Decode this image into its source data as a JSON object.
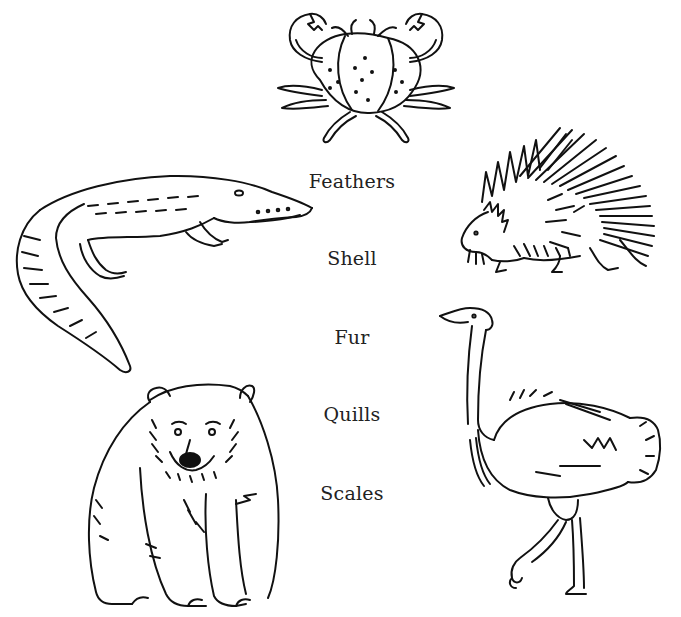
{
  "worksheet": {
    "words": [
      {
        "label": "Feathers",
        "x": 352,
        "y": 170
      },
      {
        "label": "Shell",
        "x": 352,
        "y": 247
      },
      {
        "label": "Fur",
        "x": 352,
        "y": 326
      },
      {
        "label": "Quills",
        "x": 352,
        "y": 403
      },
      {
        "label": "Scales",
        "x": 352,
        "y": 482
      }
    ],
    "animals": [
      {
        "name": "crab",
        "position": "top-center"
      },
      {
        "name": "crocodile",
        "position": "left-upper"
      },
      {
        "name": "porcupine",
        "position": "right-upper"
      },
      {
        "name": "bear",
        "position": "left-lower"
      },
      {
        "name": "ostrich",
        "position": "right-lower"
      }
    ],
    "colors": {
      "ink": "#111111",
      "text": "#222222",
      "background": "#ffffff"
    }
  }
}
